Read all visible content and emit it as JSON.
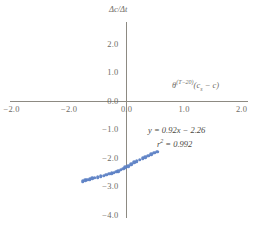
{
  "chart_data": {
    "type": "scatter",
    "title": "",
    "xlabel": "θ(T−20)(cs − c)",
    "ylabel": "Δc/Δt",
    "xlim": [
      -2.0,
      2.0
    ],
    "ylim": [
      -4.0,
      2.0
    ],
    "grid": false,
    "legend": "none",
    "x_ticks": [
      {
        "value": -2.0,
        "label": "−2.0"
      },
      {
        "value": -1.0,
        "label": "−2.0"
      },
      {
        "value": 0.0,
        "label": "0.0"
      },
      {
        "value": 1.0,
        "label": "1.0"
      },
      {
        "value": 2.0,
        "label": "2.0"
      }
    ],
    "y_ticks": [
      {
        "value": 2.0,
        "label": "2.0"
      },
      {
        "value": 1.0,
        "label": "1.0"
      },
      {
        "value": 0.0,
        "label": "0.0"
      },
      {
        "value": -1.0,
        "label": "−1.0"
      },
      {
        "value": -2.0,
        "label": "−2.0"
      },
      {
        "value": -3.0,
        "label": "−3.0"
      },
      {
        "value": -4.0,
        "label": "−4.0"
      }
    ],
    "series": [
      {
        "name": "data",
        "color": "#5b7fc4",
        "marker": "circle",
        "points": [
          [
            -0.76,
            -2.8
          ],
          [
            -0.72,
            -2.77
          ],
          [
            -0.68,
            -2.74
          ],
          [
            -0.64,
            -2.72
          ],
          [
            -0.6,
            -2.7
          ],
          [
            -0.55,
            -2.68
          ],
          [
            -0.5,
            -2.66
          ],
          [
            -0.45,
            -2.63
          ],
          [
            -0.4,
            -2.6
          ],
          [
            -0.35,
            -2.57
          ],
          [
            -0.3,
            -2.54
          ],
          [
            -0.26,
            -2.52
          ],
          [
            -0.22,
            -2.5
          ],
          [
            -0.18,
            -2.47
          ],
          [
            -0.14,
            -2.44
          ],
          [
            -0.1,
            -2.4
          ],
          [
            -0.06,
            -2.36
          ],
          [
            -0.02,
            -2.31
          ],
          [
            0.03,
            -2.26
          ],
          [
            0.08,
            -2.2
          ],
          [
            0.13,
            -2.14
          ],
          [
            0.18,
            -2.09
          ],
          [
            0.23,
            -2.04
          ],
          [
            0.28,
            -1.99
          ],
          [
            0.33,
            -1.95
          ],
          [
            0.38,
            -1.9
          ],
          [
            0.43,
            -1.85
          ],
          [
            0.48,
            -1.8
          ],
          [
            0.53,
            -1.76
          ]
        ]
      }
    ],
    "annotations": {
      "equation": "y = 0.92x − 2.26",
      "r_squared_label": "r",
      "r_squared_exponent": "2",
      "r_squared_value": " = 0.992"
    },
    "colors": {
      "marker": "#5b7fc4",
      "axis": "#8d8a82",
      "tick_label": "#6f6c66",
      "annotation": "#4a4843"
    }
  },
  "axis_title_parts": {
    "y_title": "Δc/Δt",
    "x_theta": "θ",
    "x_exponent": "(T−20)",
    "x_open": "(c",
    "x_sub": "s",
    "x_rest": " − c)"
  },
  "caption": {
    "text": ""
  }
}
